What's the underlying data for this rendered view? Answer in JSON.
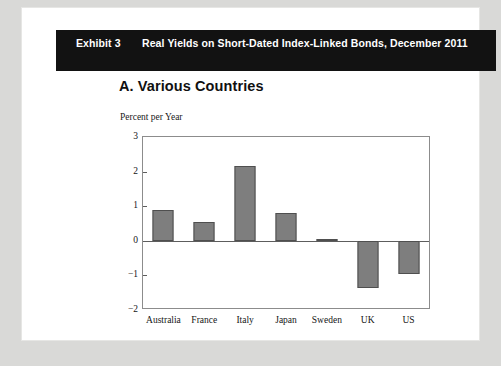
{
  "header": {
    "exhibit_label": "Exhibit 3",
    "title": "Real Yields on Short-Dated Index-Linked Bonds, December 2011",
    "background_color": "#121212",
    "text_color": "#ffffff"
  },
  "panel": {
    "heading": "A. Various Countries",
    "unit_label": "Percent per Year"
  },
  "chart_data": {
    "type": "bar",
    "title": "A. Various Countries",
    "xlabel": "",
    "ylabel": "Percent per Year",
    "categories": [
      "Australia",
      "France",
      "Italy",
      "Japan",
      "Sweden",
      "UK",
      "US"
    ],
    "values": [
      0.9,
      0.55,
      2.17,
      0.8,
      0.05,
      -1.35,
      -0.95
    ],
    "ylim": [
      -2,
      3
    ],
    "yticks": [
      3,
      2,
      1,
      0,
      -1,
      -2
    ],
    "ytick_labels": [
      "3",
      "2",
      "1",
      "0",
      "−1",
      "−2"
    ],
    "grid": false,
    "legend": false,
    "bar_color": "#7e7e7e",
    "bar_border_color": "#4f4f4f",
    "zero_line": 0
  }
}
